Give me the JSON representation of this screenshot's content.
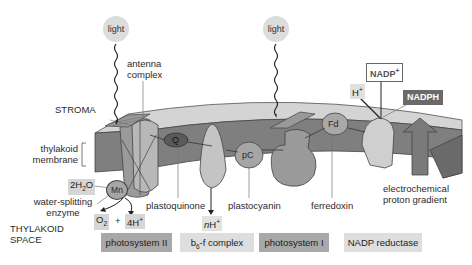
{
  "diagram": {
    "regions": {
      "stroma": "STROMA",
      "thylakoid_space_line1": "THYLAKOID",
      "thylakoid_space_line2": "SPACE",
      "membrane_line1": "thylakoid",
      "membrane_line2": "membrane"
    },
    "light_sources": [
      {
        "label": "light"
      },
      {
        "label": "light"
      }
    ],
    "labels": {
      "antenna_line1": "antenna",
      "antenna_line2": "complex",
      "water": "2H",
      "water_sub": "2",
      "water_tail": "O",
      "mn": "Mn",
      "water_splitting_line1": "water-splitting",
      "water_splitting_line2": "enzyme",
      "o2": "O",
      "o2_sub": "2",
      "plus": "+",
      "protons_4": "4H",
      "protons_sup": "+",
      "q": "Q",
      "plastoquinone": "plastoquinone",
      "nh_n": "n",
      "nh_h": "H",
      "nh_sup": "+",
      "pc": "pC",
      "plastocyanin": "plastocyanin",
      "fd": "Fd",
      "ferredoxin": "ferredoxin",
      "nadp_plus": "NADP",
      "nadp_sup": "+",
      "h_plus": "H",
      "h_sup": "+",
      "nadph": "NADPH",
      "gradient_line1": "electrochemical",
      "gradient_line2": "proton gradient"
    },
    "legend": [
      {
        "label": "photosystem II",
        "color": "#a8a8a8"
      },
      {
        "label_main": "b",
        "label_sub": "6",
        "label_tail": "-f complex",
        "color": "#dedede"
      },
      {
        "label": "photosystem I",
        "color": "#a8a8a8"
      },
      {
        "label": "NADP reductase",
        "color": "#dedede"
      }
    ],
    "colors": {
      "membrane_top": "#d2d2d2",
      "membrane_front": "#7d7d7d",
      "protein_dark": "#8e8e8e",
      "protein_light": "#c8c8c8",
      "chip_bg": "#d6d6d6",
      "nadph_bg": "#6a6a6a"
    }
  }
}
